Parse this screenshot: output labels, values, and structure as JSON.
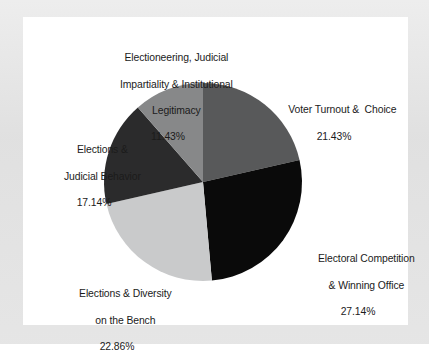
{
  "chart_data": {
    "type": "pie",
    "title": "",
    "subtitle": "",
    "xlabel": "",
    "ylabel": "",
    "legend_position": "none",
    "grid": false,
    "start_angle_deg": 0,
    "direction": "clockwise",
    "center": {
      "x": 180,
      "y": 165
    },
    "radius": 99,
    "categories": [
      "Voter Turnout &  Choice",
      "Electoral Competition & Winning Office",
      "Elections & Diversity on the Bench",
      "Elections & Judicial Behavior",
      "Electioneering, Judicial Impartiality & Institutional Legitimacy"
    ],
    "values": [
      21.43,
      27.14,
      22.86,
      17.14,
      11.43
    ],
    "value_labels": [
      "21.43%",
      "27.14%",
      "22.86%",
      "17.14%",
      "11.43%"
    ],
    "colors": [
      "#58595a",
      "#0a0a0a",
      "#c9cacb",
      "#2b2b2c",
      "#878889"
    ],
    "slices": [
      {
        "name": "voter-turnout",
        "label_lines": [
          "Voter Turnout &  Choice"
        ],
        "value": 21.43,
        "value_label": "21.43%",
        "color": "#58595a"
      },
      {
        "name": "electoral-competition",
        "label_lines": [
          "Electoral Competition",
          "& Winning Office"
        ],
        "value": 27.14,
        "value_label": "27.14%",
        "color": "#0a0a0a"
      },
      {
        "name": "elections-diversity",
        "label_lines": [
          "Elections & Diversity",
          "on the Bench"
        ],
        "value": 22.86,
        "value_label": "22.86%",
        "color": "#c9cacb"
      },
      {
        "name": "judicial-behavior",
        "label_lines": [
          "Elections &",
          "Judicial Behavior"
        ],
        "value": 17.14,
        "value_label": "17.14%",
        "color": "#2b2b2c"
      },
      {
        "name": "electioneering",
        "label_lines": [
          "Electioneering, Judicial",
          "Impartiality & Institutional",
          "Legitimacy"
        ],
        "value": 11.43,
        "value_label": "11.43%",
        "color": "#878889"
      }
    ]
  },
  "labels": {
    "electioneering": {
      "line1": "Electioneering, Judicial",
      "line2": "Impartiality & Institutional",
      "line3": "Legitimacy",
      "value": "11.43%"
    },
    "voter_turnout": {
      "line1": "Voter Turnout &  Choice",
      "value": "21.43%"
    },
    "electoral_competition": {
      "line1": "Electoral Competition",
      "line2": "& Winning Office",
      "value": "27.14%"
    },
    "elections_diversity": {
      "line1": "Elections & Diversity",
      "line2": "on the Bench",
      "value": "22.86%"
    },
    "judicial_behavior": {
      "line1": "Elections &",
      "line2": "Judicial Behavior",
      "value": "17.14%"
    }
  },
  "theme": {
    "page_background": "#e2e2e2",
    "plot_background": "#ffffff",
    "text_color": "#1b1b1b"
  }
}
